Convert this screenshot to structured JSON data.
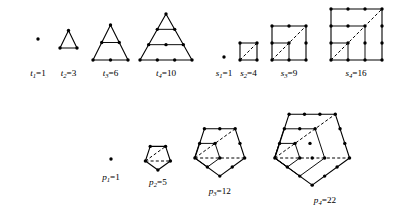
{
  "figure": {
    "background_color": "#ffffff",
    "ink_color": "#000000",
    "dot_radius": 1.7
  },
  "chart_data": {
    "type": "diagram",
    "xlabel": "",
    "ylabel": "",
    "series": [
      {
        "name": "triangular",
        "symbol": "t",
        "categories": [
          "t1",
          "t2",
          "t3",
          "t4"
        ],
        "values": [
          1,
          3,
          6,
          10
        ]
      },
      {
        "name": "square",
        "symbol": "s",
        "categories": [
          "s1",
          "s2",
          "s3",
          "s4"
        ],
        "values": [
          1,
          4,
          9,
          16
        ]
      },
      {
        "name": "pentagonal",
        "symbol": "p",
        "categories": [
          "p1",
          "p2",
          "p3",
          "p4"
        ],
        "values": [
          1,
          5,
          12,
          22
        ]
      }
    ],
    "legend": "none",
    "grid": false
  },
  "rows": {
    "triangular": {
      "symbol": "t",
      "items": [
        {
          "index": "1",
          "value": "1",
          "label": "t",
          "sub": "1",
          "eq": "=1",
          "dots": 1
        },
        {
          "index": "2",
          "value": "3",
          "label": "t",
          "sub": "2",
          "eq": "=3",
          "dots": 3
        },
        {
          "index": "3",
          "value": "6",
          "label": "t",
          "sub": "3",
          "eq": "=6",
          "dots": 6
        },
        {
          "index": "4",
          "value": "10",
          "label": "t",
          "sub": "4",
          "eq": "=10",
          "dots": 10
        }
      ]
    },
    "square": {
      "symbol": "s",
      "items": [
        {
          "index": "1",
          "value": "1",
          "label": "s",
          "sub": "1",
          "eq": "=1",
          "dots": 1
        },
        {
          "index": "2",
          "value": "4",
          "label": "s",
          "sub": "2",
          "eq": "=4",
          "dots": 4
        },
        {
          "index": "3",
          "value": "9",
          "label": "s",
          "sub": "3",
          "eq": "=9",
          "dots": 9
        },
        {
          "index": "4",
          "value": "16",
          "label": "s",
          "sub": "4",
          "eq": "=16",
          "dots": 16
        }
      ]
    },
    "pentagonal": {
      "symbol": "p",
      "items": [
        {
          "index": "1",
          "value": "1",
          "label": "p",
          "sub": "1",
          "eq": "=1",
          "dots": 1
        },
        {
          "index": "2",
          "value": "5",
          "label": "p",
          "sub": "2",
          "eq": "=5",
          "dots": 5
        },
        {
          "index": "3",
          "value": "12",
          "label": "p",
          "sub": "3",
          "eq": "=12",
          "dots": 12
        },
        {
          "index": "4",
          "value": "22",
          "label": "p",
          "sub": "4",
          "eq": "=22",
          "dots": 22
        }
      ]
    }
  }
}
